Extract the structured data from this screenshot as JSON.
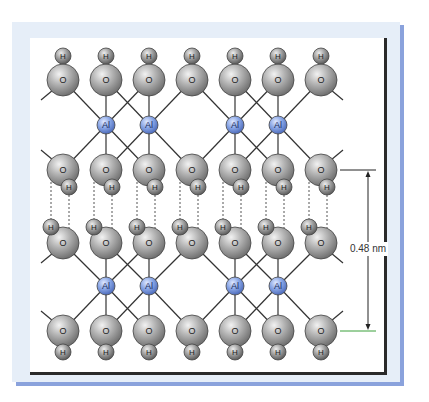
{
  "diagram": {
    "atoms": {
      "oxygen_label": "O",
      "hydrogen_label": "H",
      "aluminum_label": "Al"
    },
    "colors": {
      "oxygen": "#9a9a9a",
      "hydrogen": "#8c8c8c",
      "aluminum": "#7c9be0",
      "bond": "#333333",
      "hbond": "#555555",
      "dimension_line": "#222222",
      "dimension_tick_bottom": "#3aa03a",
      "frame_bg": "#e6eef8",
      "frame_shadow": "#8aa2dc",
      "frame_border": "#2a2a2a"
    },
    "columns_x": [
      63,
      106,
      149,
      192,
      235,
      278,
      321
    ],
    "rows": {
      "top_H_y": 56,
      "top_O_y": 80,
      "upper_Al_y": 125,
      "mid_upper_O_y": 170,
      "mid_upper_H_y": 187,
      "mid_lower_H_y": 227,
      "mid_lower_O_y": 243,
      "lower_Al_y": 286,
      "bottom_O_y": 331,
      "bottom_H_y": 352
    },
    "al_columns_x": [
      106,
      149,
      235,
      278
    ],
    "dimension": {
      "label": "0.48 nm",
      "x": 368,
      "y_top": 170,
      "y_bottom": 331
    }
  }
}
